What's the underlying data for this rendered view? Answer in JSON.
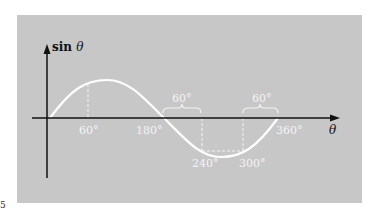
{
  "figure": {
    "y_axis_label": "sin",
    "y_axis_symbol": "θ",
    "x_axis_label": "θ",
    "tick_labels": {
      "deg60": "60°",
      "deg180": "180°",
      "deg240": "240°",
      "deg300": "300°",
      "deg360": "360°"
    },
    "brace_labels": {
      "left": "60°",
      "right": "60°"
    },
    "margin_mark": "5",
    "colors": {
      "background": "#c7c7c7",
      "curve": "#ffffff",
      "axes": "#111111",
      "labels": "#f4f4f4"
    }
  }
}
